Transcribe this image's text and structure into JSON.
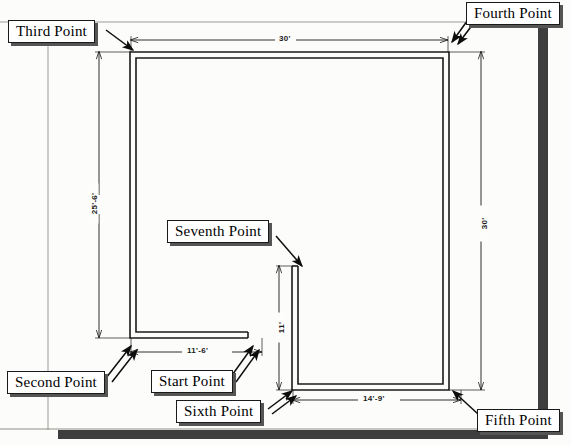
{
  "diagram": {
    "type": "architectural-floor-plan",
    "units": "feet-inches",
    "colors": {
      "line": "#1a1a1a",
      "paper": "#fdfdfb",
      "callout_shadow": "#555555",
      "frame": "#3a3a3a"
    }
  },
  "callouts": [
    {
      "id": "third",
      "label": "Third Point",
      "x": 8,
      "y": 20,
      "arrow_to_x": 132,
      "arrow_to_y": 46
    },
    {
      "id": "fourth",
      "label": "Fourth Point",
      "x": 466,
      "y": 2,
      "arrow_to_x": 449,
      "arrow_to_y": 49
    },
    {
      "id": "seventh",
      "label": "Seventh Point",
      "x": 167,
      "y": 220,
      "arrow_to_x": 300,
      "arrow_to_y": 266
    },
    {
      "id": "second",
      "label": "Second Point",
      "x": 7,
      "y": 371,
      "arrow_to_x": 130,
      "arrow_to_y": 341
    },
    {
      "id": "start",
      "label": "Start Point",
      "x": 151,
      "y": 370,
      "arrow_to_x": 248,
      "arrow_to_y": 341
    },
    {
      "id": "sixth",
      "label": "Sixth Point",
      "x": 176,
      "y": 400,
      "arrow_to_x": 290,
      "arrow_to_y": 391
    },
    {
      "id": "fifth",
      "label": "Fifth Point",
      "x": 477,
      "y": 409,
      "arrow_to_x": 452,
      "arrow_to_y": 392
    }
  ],
  "dimensions": [
    {
      "id": "top-width",
      "value": "30'",
      "orientation": "horizontal",
      "x": 284,
      "y": 33
    },
    {
      "id": "left-height",
      "value": "25'-6'",
      "orientation": "vertical",
      "x": 89,
      "y": 203
    },
    {
      "id": "right-height",
      "value": "30'",
      "orientation": "vertical",
      "x": 483,
      "y": 223
    },
    {
      "id": "bottom-left",
      "value": "11'-6'",
      "orientation": "horizontal",
      "x": 190,
      "y": 352
    },
    {
      "id": "bottom-right",
      "value": "14'-9'",
      "orientation": "horizontal",
      "x": 368,
      "y": 400
    },
    {
      "id": "inner-height",
      "value": "11'",
      "orientation": "vertical",
      "x": 279,
      "y": 327
    }
  ],
  "wall_outline": {
    "note": "Double-line wall polygon traced start->second->third->fourth->fifth->sixth->seventh",
    "outer": "M248,338 L130,338 L130,52 L449,52 L449,390 L292,390 L292,266 L297,266",
    "inner": "M248,332 L136,332 L136,58 L443,58 L443,384 L298,384 L298,266"
  },
  "frame": {
    "right_bar": {
      "x": 538,
      "y": 24,
      "w": 10,
      "h": 406
    },
    "bottom_bar": {
      "x": 58,
      "y": 430,
      "w": 490,
      "h": 9
    },
    "top_rule_y": 22,
    "left_rule_x": 48
  }
}
